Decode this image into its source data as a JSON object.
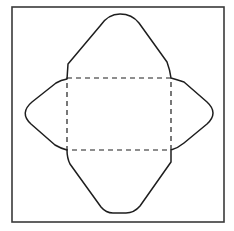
{
  "diagram": {
    "frame": {
      "x": 12,
      "y": 7,
      "width": 212,
      "height": 215
    },
    "fold_rect": {
      "x": 67,
      "y": 78,
      "width": 104,
      "height": 72
    },
    "flaps": [
      {
        "name": "top-flap",
        "apex": [
          120,
          14
        ]
      },
      {
        "name": "bottom-flap",
        "apex": [
          120,
          213
        ]
      },
      {
        "name": "left-flap",
        "apex": [
          22,
          113
        ]
      },
      {
        "name": "right-flap",
        "apex": [
          216,
          114
        ]
      }
    ],
    "line_styles": {
      "cut": "solid",
      "fold": "dashed"
    },
    "colors": {
      "background": "#ffffff",
      "line": "#1e1e1e",
      "frame": "#3a3a3a"
    }
  }
}
